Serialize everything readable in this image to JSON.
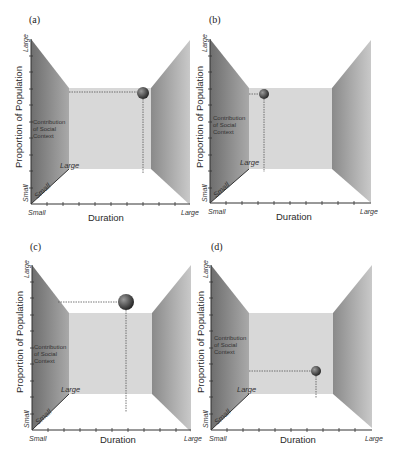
{
  "figure": {
    "axis": {
      "y_title": "Proportion of Population",
      "x_title": "Duration",
      "depth_label": "Contribution of Social Context",
      "depth_label_lines": [
        "Contribution",
        "of Social",
        "Context"
      ],
      "small": "Small",
      "large": "Large"
    },
    "colors": {
      "wall_dark": "#7a7a7a",
      "wall_light": "#c8c8c8",
      "back_wall": "#d9d9d9",
      "ball_dark": "#222222",
      "ball_light": "#9a9a9a",
      "guide_line": "#555555",
      "axis_line": "#333333"
    },
    "panels": [
      {
        "id": "a",
        "label": "(a)",
        "ball": {
          "duration": "large",
          "proportion": "large",
          "social_context": "medium",
          "cx": 143,
          "cy": 93,
          "r": 6
        },
        "guide_h": {
          "x1": 69,
          "x2": 137,
          "y": 92
        },
        "guide_v": {
          "x": 143,
          "y1": 99,
          "y2": 173
        }
      },
      {
        "id": "b",
        "label": "(b)",
        "ball": {
          "duration": "small",
          "proportion": "large",
          "social_context": "medium",
          "cx": 264,
          "cy": 94,
          "r": 5
        },
        "guide_h": {
          "x1": 249,
          "x2": 259,
          "y": 94
        },
        "guide_v": {
          "x": 264,
          "y1": 99,
          "y2": 172
        }
      },
      {
        "id": "c",
        "label": "(c)",
        "ball": {
          "duration": "medium",
          "proportion": "large",
          "social_context": "small",
          "cx": 126,
          "cy": 302,
          "r": 8
        },
        "guide_h": {
          "x1": 58,
          "x2": 118,
          "y": 302
        },
        "guide_v": {
          "x": 126,
          "y1": 310,
          "y2": 412
        }
      },
      {
        "id": "d",
        "label": "(d)",
        "ball": {
          "duration": "large",
          "proportion": "small",
          "social_context": "medium",
          "cx": 316,
          "cy": 371,
          "r": 5
        },
        "guide_h": {
          "x1": 249,
          "x2": 311,
          "y": 371
        },
        "guide_v": {
          "x": 316,
          "y1": 376,
          "y2": 398
        }
      }
    ]
  }
}
